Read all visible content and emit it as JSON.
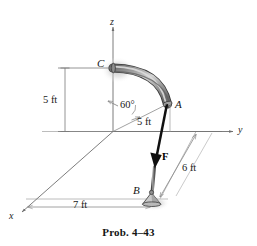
{
  "figure": {
    "caption": "Prob. 4–43",
    "axes": [
      {
        "name": "z",
        "label": "z"
      },
      {
        "name": "y",
        "label": "y"
      },
      {
        "name": "x",
        "label": "x"
      }
    ],
    "points": [
      {
        "name": "C",
        "label": "C"
      },
      {
        "name": "A",
        "label": "A"
      },
      {
        "name": "B",
        "label": "B"
      }
    ],
    "dimensions": [
      {
        "name": "height",
        "label": "5 ft"
      },
      {
        "name": "angle",
        "label": "60°"
      },
      {
        "name": "radius",
        "label": "5 ft"
      },
      {
        "name": "depth",
        "label": "6 ft"
      },
      {
        "name": "width",
        "label": "7 ft"
      }
    ],
    "force": {
      "label": "F"
    },
    "colors": {
      "background": "#ffffff",
      "pipe_outline": "#3a3a3a",
      "pipe_fill": "#9a9a9a",
      "pipe_highlight": "#d6d6d6",
      "construction_line": "#a8a8a8",
      "axis_line": "#6e6e6e",
      "member": "#1a1a1a",
      "text": "#151515",
      "shadow": "#c9c9c9"
    }
  }
}
